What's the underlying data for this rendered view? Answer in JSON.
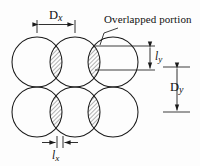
{
  "figure": {
    "background_color": "#fdfdfd",
    "line_color": "#1a1a1a",
    "hatch_color": "#4a4a4a",
    "labels": {
      "dx": {
        "base": "D",
        "sub": "x",
        "full": "Dx"
      },
      "dy": {
        "base": "D",
        "sub": "y",
        "full": "Dy"
      },
      "ly": {
        "base": "l",
        "sub": "y",
        "full": "ly"
      },
      "lx": {
        "base": "l",
        "sub": "x",
        "full": "lx"
      },
      "overlapped": "Overlapped portion"
    },
    "geometry": {
      "circle_radius": 25,
      "columns": 3,
      "rows": 2,
      "column_centers_x": [
        37,
        75,
        113
      ],
      "row_centers_y": [
        62,
        112
      ],
      "horizontal_pitch": 38,
      "vertical_pitch": 50
    },
    "dimensions": [
      {
        "name": "Dx",
        "orientation": "horizontal",
        "from": 37,
        "to": 75,
        "axis_position": 24
      },
      {
        "name": "ly",
        "orientation": "vertical",
        "from": 46,
        "to": 70,
        "axis_position": 150
      },
      {
        "name": "Dy",
        "orientation": "vertical",
        "from": 67,
        "to": 112,
        "axis_position": 177
      },
      {
        "name": "lx",
        "orientation": "horizontal",
        "from": 57,
        "to": 63,
        "axis_position": 142
      }
    ]
  }
}
